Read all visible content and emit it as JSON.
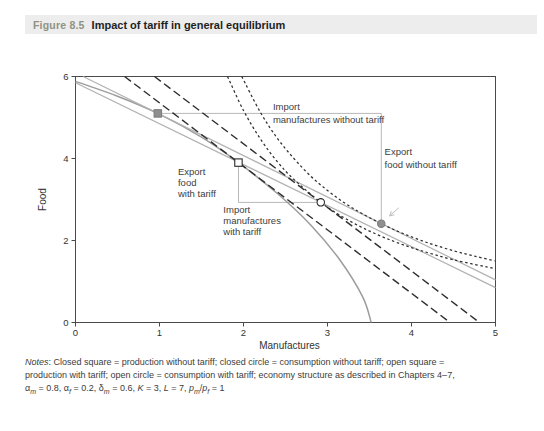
{
  "figure": {
    "label": "Figure 8.5",
    "title": "Impact of tariff in general equilibrium"
  },
  "chart_data": {
    "type": "line",
    "title": "Impact of tariff in general equilibrium",
    "xlabel": "Manufactures",
    "ylabel": "Food",
    "xlim": [
      0,
      5
    ],
    "ylim": [
      0,
      6
    ],
    "xticks": [
      0,
      1,
      2,
      3,
      4,
      5
    ],
    "yticks": [
      0,
      2,
      4,
      6
    ],
    "grid": false,
    "legend": "none",
    "colors": {
      "gray_curve": "#9c9c9c",
      "gray_line": "#b2b2b2",
      "dark": "#2e2e2e",
      "connector": "#b8b8b8",
      "marker_fill": "#8f8f8f",
      "marker_edge": "#7d7d7d",
      "open_edge": "#2a2a2a",
      "axis": "#4a4a4a",
      "text": "#3d3d3d"
    },
    "series": [
      {
        "name": "ppf-curve",
        "role": "production possibility frontier",
        "colorKey": "gray_curve",
        "dash": "solid",
        "width": 1.5,
        "smooth": true,
        "points": [
          [
            0,
            5.88
          ],
          [
            0.5,
            5.52
          ],
          [
            0.98,
            5.1
          ],
          [
            1.5,
            4.52
          ],
          [
            1.94,
            3.9
          ],
          [
            2.4,
            3.15
          ],
          [
            2.8,
            2.38
          ],
          [
            3.15,
            1.52
          ],
          [
            3.42,
            0.62
          ],
          [
            3.52,
            0
          ]
        ]
      },
      {
        "name": "world-price-line-no-tariff",
        "role": "world price line without tariff (slope -1)",
        "colorKey": "gray_line",
        "dash": "solid",
        "width": 1.2,
        "smooth": false,
        "points": [
          [
            0.09,
            6
          ],
          [
            5,
            1.04
          ]
        ]
      },
      {
        "name": "world-price-line-with-tariff",
        "role": "world price line through tariff production point (slope -1)",
        "colorKey": "gray_line",
        "dash": "solid",
        "width": 1.2,
        "smooth": false,
        "points": [
          [
            0,
            5.85
          ],
          [
            5,
            0.85
          ]
        ]
      },
      {
        "name": "domestic-price-line-production",
        "role": "domestic price line with tariff at production point",
        "colorKey": "dark",
        "dash": "long-dash",
        "width": 1.4,
        "smooth": false,
        "points": [
          [
            0.585,
            6
          ],
          [
            4.46,
            0
          ]
        ]
      },
      {
        "name": "domestic-price-line-consumption",
        "role": "domestic price line with tariff at consumption point",
        "colorKey": "dark",
        "dash": "long-dash",
        "width": 1.4,
        "smooth": false,
        "points": [
          [
            0.94,
            6
          ],
          [
            4.81,
            0
          ]
        ]
      },
      {
        "name": "indifference-curve-no-tariff",
        "role": "indifference curve without tariff",
        "colorKey": "dark",
        "dash": "short-dash",
        "width": 1.25,
        "smooth": true,
        "points": [
          [
            1.98,
            6
          ],
          [
            2.2,
            5.13
          ],
          [
            2.4,
            4.5
          ],
          [
            2.6,
            4.0
          ],
          [
            2.8,
            3.57
          ],
          [
            3.0,
            3.22
          ],
          [
            3.2,
            2.92
          ],
          [
            3.4,
            2.67
          ],
          [
            3.64,
            2.41
          ],
          [
            3.9,
            2.17
          ],
          [
            4.2,
            1.94
          ],
          [
            4.5,
            1.75
          ],
          [
            4.75,
            1.62
          ],
          [
            5,
            1.5
          ]
        ]
      },
      {
        "name": "indifference-curve-with-tariff",
        "role": "indifference curve with tariff",
        "colorKey": "dark",
        "dash": "short-dash",
        "width": 1.25,
        "smooth": true,
        "points": [
          [
            1.81,
            6
          ],
          [
            2.0,
            5.17
          ],
          [
            2.2,
            4.48
          ],
          [
            2.4,
            3.93
          ],
          [
            2.6,
            3.49
          ],
          [
            2.92,
            2.93
          ],
          [
            3.2,
            2.55
          ],
          [
            3.5,
            2.23
          ],
          [
            3.8,
            1.97
          ],
          [
            4.1,
            1.76
          ],
          [
            4.5,
            1.53
          ],
          [
            5,
            1.31
          ]
        ]
      }
    ],
    "connectors": [
      {
        "name": "import-manufactures-without-tariff-connector",
        "points": [
          [
            0.98,
            5.1
          ],
          [
            3.64,
            5.1
          ]
        ]
      },
      {
        "name": "export-food-without-tariff-connector",
        "points": [
          [
            3.64,
            5.1
          ],
          [
            3.64,
            2.41
          ]
        ]
      },
      {
        "name": "export-food-with-tariff-connector",
        "points": [
          [
            1.94,
            3.9
          ],
          [
            1.94,
            2.93
          ]
        ]
      },
      {
        "name": "import-manufactures-with-tariff-connector",
        "points": [
          [
            1.94,
            2.93
          ],
          [
            2.92,
            2.93
          ]
        ]
      }
    ],
    "markers": [
      {
        "name": "production-without-tariff-marker",
        "shape": "square",
        "filled": true,
        "x": 0.98,
        "y": 5.1
      },
      {
        "name": "consumption-without-tariff-marker",
        "shape": "circle",
        "filled": true,
        "x": 3.64,
        "y": 2.41
      },
      {
        "name": "production-with-tariff-marker",
        "shape": "square",
        "filled": false,
        "x": 1.94,
        "y": 3.9
      },
      {
        "name": "consumption-with-tariff-marker",
        "shape": "circle",
        "filled": false,
        "x": 2.92,
        "y": 2.93
      }
    ],
    "annotations": [
      {
        "name": "import-without-tariff-label-1",
        "text": "Import",
        "x": 2.35,
        "y": 5.39
      },
      {
        "name": "import-without-tariff-label-2",
        "text": "manufactures without tariff",
        "x": 2.35,
        "y": 5.05
      },
      {
        "name": "export-food-without-tariff-label-1",
        "text": "Export",
        "x": 3.68,
        "y": 4.29
      },
      {
        "name": "export-food-without-tariff-label-2",
        "text": "food without tariff",
        "x": 3.68,
        "y": 3.97
      },
      {
        "name": "export-food-with-tariff-label-1",
        "text": "Export",
        "x": 1.22,
        "y": 3.8
      },
      {
        "name": "export-food-with-tariff-label-2",
        "text": "food",
        "x": 1.22,
        "y": 3.53
      },
      {
        "name": "export-food-with-tariff-label-3",
        "text": "with tariff",
        "x": 1.22,
        "y": 3.26
      },
      {
        "name": "import-with-tariff-label-1",
        "text": "Import",
        "x": 1.76,
        "y": 2.87
      },
      {
        "name": "import-with-tariff-label-2",
        "text": "manufactures",
        "x": 1.76,
        "y": 2.6
      },
      {
        "name": "import-with-tariff-label-3",
        "text": "with tariff",
        "x": 1.76,
        "y": 2.33
      }
    ],
    "arrow_mark": {
      "name": "small-arrow-mark",
      "points": [
        [
          3.85,
          2.8
        ],
        [
          3.74,
          2.6
        ]
      ]
    }
  },
  "notes": {
    "lines": [
      [
        {
          "t": "Notes",
          "i": true
        },
        {
          "t": ": Closed square = production without tariff; closed circle = consumption without tariff; open square ="
        }
      ],
      [
        {
          "t": "production with tariff; open circle = consumption with tariff; economy structure as described in Chapters 4–7,"
        }
      ],
      [
        {
          "t": "α"
        },
        {
          "t": "m",
          "sub": true
        },
        {
          "t": " = 0.8, "
        },
        {
          "t": "α"
        },
        {
          "t": "f",
          "sub": true
        },
        {
          "t": " = 0.2, "
        },
        {
          "t": "δ"
        },
        {
          "t": "m",
          "sub": true
        },
        {
          "t": " = 0.6, "
        },
        {
          "t": "K",
          "i": true
        },
        {
          "t": " = 3, "
        },
        {
          "t": "L",
          "i": true
        },
        {
          "t": " = 7, "
        },
        {
          "t": "p",
          "i": true
        },
        {
          "t": "m",
          "sub": true
        },
        {
          "t": "/"
        },
        {
          "t": "p",
          "i": true
        },
        {
          "t": "f",
          "sub": true
        },
        {
          "t": " = 1"
        }
      ]
    ]
  }
}
